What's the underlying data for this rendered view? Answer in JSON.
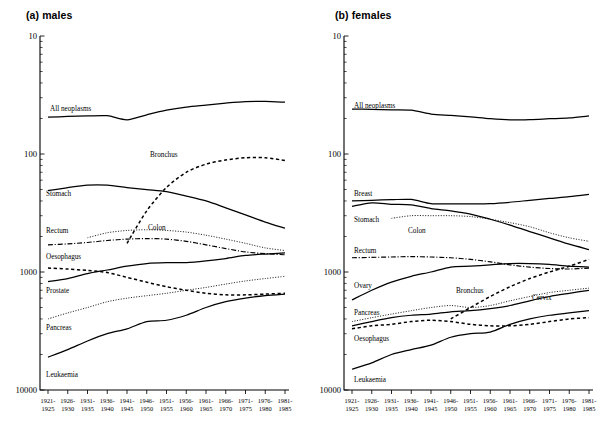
{
  "figure": {
    "panels": [
      {
        "id": "males",
        "title": "(a) males"
      },
      {
        "id": "females",
        "title": "(b) females"
      }
    ]
  },
  "chart_data": [
    {
      "type": "line",
      "title": "(a) males",
      "xlabel": "",
      "ylabel": "",
      "yscale": "log",
      "ylim": [
        10,
        10000
      ],
      "yticks": [
        10,
        100,
        1000,
        10000
      ],
      "ytick_labels": [
        "10",
        "100",
        "1000",
        "10000"
      ],
      "grid": false,
      "legend": "inline-labels",
      "categories": [
        "1921-1925",
        "1926-1930",
        "1931-1935",
        "1936-1940",
        "1941-1945",
        "1946-1950",
        "1951-1955",
        "1956-1960",
        "1961-1965",
        "1966-1970",
        "1971-1975",
        "1976-1980",
        "1981-1985"
      ],
      "series": [
        {
          "name": "All neoplasms",
          "style": "solid",
          "values": [
            2050,
            2080,
            2100,
            2110,
            1950,
            2150,
            2350,
            2500,
            2600,
            2700,
            2780,
            2790,
            2750
          ]
        },
        {
          "name": "Bronchus",
          "style": "dashed",
          "values": [
            null,
            null,
            null,
            null,
            175,
            330,
            520,
            700,
            820,
            890,
            930,
            930,
            880
          ]
        },
        {
          "name": "Stomach",
          "style": "solid",
          "values": [
            490,
            520,
            545,
            545,
            520,
            500,
            480,
            440,
            400,
            350,
            305,
            265,
            235
          ]
        },
        {
          "name": "Colon",
          "style": "dotted",
          "values": [
            null,
            null,
            195,
            215,
            225,
            228,
            225,
            218,
            205,
            190,
            175,
            160,
            152
          ]
        },
        {
          "name": "Rectum",
          "style": "dashdot",
          "values": [
            170,
            173,
            178,
            185,
            190,
            192,
            190,
            182,
            170,
            158,
            148,
            143,
            140
          ]
        },
        {
          "name": "Oesophagus",
          "style": "solid",
          "values": [
            83,
            88,
            97,
            104,
            112,
            118,
            120,
            120,
            124,
            130,
            138,
            142,
            145
          ]
        },
        {
          "name": "Prostate",
          "style": "dotted",
          "values": [
            40,
            45,
            50,
            56,
            60,
            63,
            66,
            70,
            74,
            79,
            84,
            88,
            92
          ]
        },
        {
          "name": "Pancreas",
          "style": "solid",
          "values": [
            19,
            22,
            26,
            30,
            33,
            38,
            39,
            43,
            50,
            56,
            60,
            63,
            65
          ]
        },
        {
          "name": "Leukaemia",
          "style": "dashed",
          "values": [
            108,
            106,
            103,
            99,
            90,
            82,
            75,
            70,
            66,
            64,
            64,
            65,
            66
          ]
        }
      ]
    },
    {
      "type": "line",
      "title": "(b) females",
      "xlabel": "",
      "ylabel": "",
      "yscale": "log",
      "ylim": [
        10,
        10000
      ],
      "yticks": [
        10,
        100,
        1000,
        10000
      ],
      "ytick_labels": [
        "10",
        "100",
        "1000",
        "10000"
      ],
      "grid": false,
      "legend": "inline-labels",
      "categories": [
        "1921-1925",
        "1926-1930",
        "1931-1935",
        "1936-1940",
        "1941-1945",
        "1946-1950",
        "1951-1955",
        "1956-1960",
        "1961-1965",
        "1966-1970",
        "1971-1975",
        "1976-1980",
        "1981-1985"
      ],
      "series": [
        {
          "name": "All neoplasms",
          "style": "solid",
          "values": [
            2400,
            2390,
            2370,
            2350,
            2180,
            2120,
            2060,
            1990,
            1950,
            1960,
            1990,
            2020,
            2100
          ]
        },
        {
          "name": "Breast",
          "style": "solid",
          "values": [
            400,
            405,
            410,
            412,
            380,
            378,
            378,
            380,
            390,
            405,
            420,
            435,
            455
          ]
        },
        {
          "name": "Stomach",
          "style": "solid",
          "values": [
            360,
            385,
            375,
            370,
            345,
            330,
            310,
            280,
            250,
            220,
            195,
            172,
            155
          ]
        },
        {
          "name": "Colon",
          "style": "dotted",
          "values": [
            null,
            null,
            285,
            300,
            300,
            300,
            295,
            280,
            262,
            242,
            215,
            195,
            182
          ]
        },
        {
          "name": "Rectum",
          "style": "dashdot",
          "values": [
            132,
            133,
            134,
            135,
            134,
            132,
            128,
            122,
            115,
            110,
            107,
            106,
            108
          ]
        },
        {
          "name": "Ovary",
          "style": "solid",
          "values": [
            58,
            70,
            82,
            92,
            100,
            110,
            112,
            115,
            118,
            118,
            116,
            112,
            110
          ]
        },
        {
          "name": "Bronchus",
          "style": "dashed",
          "values": [
            null,
            null,
            null,
            null,
            null,
            40,
            50,
            62,
            75,
            88,
            100,
            112,
            128
          ]
        },
        {
          "name": "Pancreas",
          "style": "dotted",
          "values": [
            38,
            41,
            44,
            47,
            50,
            52,
            50,
            52,
            57,
            62,
            67,
            70,
            73
          ]
        },
        {
          "name": "Oesophagus",
          "style": "dashed",
          "values": [
            33,
            35,
            36,
            38,
            39,
            38,
            36,
            35,
            35,
            36,
            38,
            40,
            41
          ]
        },
        {
          "name": "Cervix",
          "style": "solid",
          "values": [
            35,
            38,
            41,
            43,
            44,
            46,
            47,
            49,
            52,
            57,
            62,
            66,
            70
          ]
        },
        {
          "name": "Leukaemia",
          "style": "solid",
          "values": [
            15,
            17,
            20,
            22,
            24,
            28,
            30,
            31,
            36,
            40,
            43,
            45,
            47
          ]
        }
      ]
    }
  ],
  "axis": {
    "y_tick_labels": [
      "10000",
      "1000",
      "100",
      "10"
    ],
    "x_tick_labels": [
      {
        "top": "1921-",
        "bottom": "1925"
      },
      {
        "top": "1926-",
        "bottom": "1930"
      },
      {
        "top": "1931-",
        "bottom": "1935"
      },
      {
        "top": "1936-",
        "bottom": "1940"
      },
      {
        "top": "1941-",
        "bottom": "1945"
      },
      {
        "top": "1946-",
        "bottom": "1950"
      },
      {
        "top": "1951-",
        "bottom": "1955"
      },
      {
        "top": "1956-",
        "bottom": "1960"
      },
      {
        "top": "1961-",
        "bottom": "1965"
      },
      {
        "top": "1966-",
        "bottom": "1970"
      },
      {
        "top": "1971-",
        "bottom": "1975"
      },
      {
        "top": "1976-",
        "bottom": "1980"
      },
      {
        "top": "1981-",
        "bottom": "1985"
      }
    ]
  },
  "labels": {
    "males": [
      {
        "text": "All neoplasms",
        "x": 50,
        "y": 111
      },
      {
        "text": "Bronchus",
        "x": 150,
        "y": 157
      },
      {
        "text": "Stomach",
        "x": 46,
        "y": 196
      },
      {
        "text": "Colon",
        "x": 148,
        "y": 230
      },
      {
        "text": "Rectum",
        "x": 46,
        "y": 233
      },
      {
        "text": "Oesophagus",
        "x": 46,
        "y": 259
      },
      {
        "text": "Prostate",
        "x": 46,
        "y": 293
      },
      {
        "text": "Pancreas",
        "x": 46,
        "y": 330
      },
      {
        "text": "Leukaemia",
        "x": 46,
        "y": 377
      }
    ],
    "females": [
      {
        "text": "All neoplasms",
        "x": 50,
        "y": 108
      },
      {
        "text": "Breast",
        "x": 50,
        "y": 196
      },
      {
        "text": "Stomach",
        "x": 50,
        "y": 222
      },
      {
        "text": "Colon",
        "x": 104,
        "y": 233
      },
      {
        "text": "Rectum",
        "x": 50,
        "y": 253
      },
      {
        "text": "Ovary",
        "x": 50,
        "y": 288
      },
      {
        "text": "Bronchus",
        "x": 152,
        "y": 293
      },
      {
        "text": "Pancreas",
        "x": 50,
        "y": 315
      },
      {
        "text": "Cervix",
        "x": 228,
        "y": 300
      },
      {
        "text": "Oesophagus",
        "x": 50,
        "y": 341
      },
      {
        "text": "Leukaemia",
        "x": 50,
        "y": 382
      }
    ]
  }
}
